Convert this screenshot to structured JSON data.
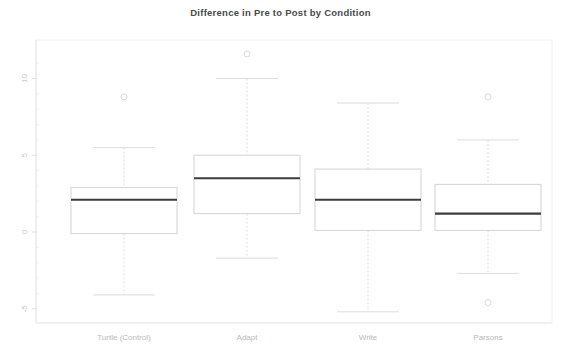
{
  "chart_data": {
    "type": "box",
    "title": "Difference in Pre to Post by Condition",
    "xlabel": "",
    "ylabel": "",
    "categories": [
      "Turtle (Control)",
      "Adapt",
      "Write",
      "Parsons"
    ],
    "yticks": [
      10,
      5,
      0,
      -5
    ],
    "ytick_labels": [
      "10",
      "5",
      "0",
      "-5"
    ],
    "ylim": [
      -7.5,
      11.5
    ],
    "grid": false,
    "legend": null,
    "boxes": [
      {
        "category": "Turtle (Control)",
        "whisker_high": 5.5,
        "q3": 2.9,
        "median": 2.1,
        "q1": -0.1,
        "whisker_low": -4.1,
        "outliers": [
          8.8
        ]
      },
      {
        "category": "Adapt",
        "whisker_high": 10.0,
        "q3": 5.0,
        "median": 3.5,
        "q1": 1.2,
        "whisker_low": -1.7,
        "outliers": [
          11.6
        ]
      },
      {
        "category": "Write",
        "whisker_high": 8.4,
        "q3": 4.1,
        "median": 2.1,
        "q1": 0.1,
        "whisker_low": -5.2,
        "outliers": []
      },
      {
        "category": "Parsons",
        "whisker_high": 6.0,
        "q3": 3.1,
        "median": 1.2,
        "q1": 0.1,
        "whisker_low": -2.7,
        "outliers": [
          8.8,
          -4.6
        ]
      }
    ],
    "colors": {
      "median_line": "#3d3d3d",
      "box_edge": "#d8d8d8",
      "whisker": "#dcdcdc",
      "axis": "#e2e2e2",
      "tick_text": "#c4c4c4",
      "title_text": "#4a4a4a",
      "outlier": "#dadada",
      "background": "#ffffff"
    }
  }
}
